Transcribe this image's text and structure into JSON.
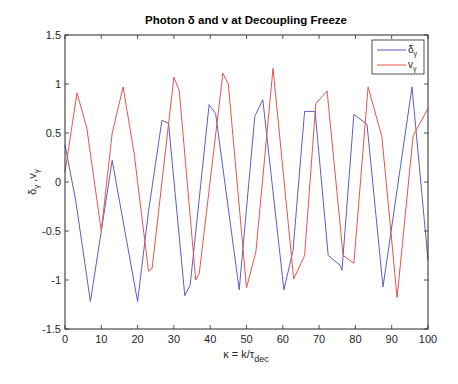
{
  "chart_data": {
    "type": "line",
    "title": "Photon δ and v at Decoupling Freeze",
    "xlabel": "κ = k/τ_dec",
    "xlabel_main": "κ = k/τ",
    "xlabel_sub": "dec",
    "ylabel": "δ_γ , v_γ",
    "xlim": [
      0,
      100
    ],
    "ylim": [
      -1.5,
      1.5
    ],
    "xticks": [
      0,
      10,
      20,
      30,
      40,
      50,
      60,
      70,
      80,
      90,
      100
    ],
    "yticks": [
      -1.5,
      -1,
      -0.5,
      0,
      0.5,
      1,
      1.5
    ],
    "ytick_labels": [
      "-1.5",
      "-1",
      "-0.5",
      "0",
      "0.5",
      "1",
      "1.5"
    ],
    "grid": false,
    "legend_position": "northeast",
    "series": [
      {
        "name": "δ_γ",
        "color": "#5b5fc7",
        "x": [
          0,
          3,
          7,
          10,
          13,
          16,
          20,
          23,
          26.7,
          28.5,
          33,
          34.5,
          39.7,
          41.5,
          48,
          52.3,
          54.5,
          60.3,
          62.8,
          66,
          68.9,
          72.5,
          75.8,
          76.3,
          79.6,
          83.2,
          87.6,
          95.6,
          100
        ],
        "values": [
          0.38,
          -0.2,
          -1.22,
          -0.5,
          0.22,
          -0.4,
          -1.22,
          -0.3,
          0.63,
          0.6,
          -1.16,
          -1.05,
          0.79,
          0.7,
          -1.1,
          0.67,
          0.84,
          -1.1,
          -0.7,
          0.72,
          0.72,
          -0.75,
          -0.85,
          -0.9,
          0.69,
          0.59,
          -1.07,
          0.97,
          -0.8
        ]
      },
      {
        "name": "v_γ",
        "color": "#e8554a",
        "x": [
          0,
          3.3,
          6,
          10,
          13,
          16,
          19,
          23,
          24,
          30,
          31.5,
          36,
          37,
          43.5,
          45,
          50,
          52.6,
          57.3,
          63,
          66,
          69.1,
          72.2,
          76.6,
          79.6,
          83.5,
          87.3,
          91.5,
          95.9,
          100
        ],
        "values": [
          0.1,
          0.91,
          0.55,
          -0.5,
          0.5,
          0.97,
          0.3,
          -0.91,
          -0.88,
          1.07,
          0.93,
          -1.0,
          -0.93,
          1.11,
          1.0,
          -1.08,
          -0.71,
          1.16,
          -0.99,
          -0.75,
          0.8,
          0.93,
          -0.75,
          -0.83,
          0.97,
          0.46,
          -1.18,
          0.47,
          0.75
        ]
      }
    ]
  },
  "legend": {
    "items": [
      {
        "label": "δ",
        "sub": "γ",
        "color": "#5b5fc7"
      },
      {
        "label": "v",
        "sub": "γ",
        "color": "#e8554a"
      }
    ]
  },
  "ylabel": {
    "delta": "δ",
    "v": "v",
    "sub": "γ",
    "sep": " ,"
  }
}
